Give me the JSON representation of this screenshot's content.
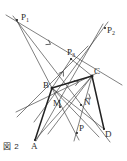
{
  "figure": {
    "caption": "図 2",
    "background_color": "#ffffff",
    "line_color": "#3a3a3a",
    "thick_line_color": "#222222",
    "label_color": "#2b2b2b",
    "width": 127,
    "height": 161
  },
  "points": [
    {
      "id": "P1",
      "label": "P",
      "subscript": "1",
      "x": 17,
      "y": 20,
      "label_x": 21,
      "label_y": 13
    },
    {
      "id": "P2",
      "label": "P",
      "subscript": "2",
      "x": 105,
      "y": 28,
      "label_x": 107,
      "label_y": 26
    },
    {
      "id": "P3",
      "label": "P",
      "subscript": "3",
      "x": 71,
      "y": 59,
      "label_x": 67,
      "label_y": 48
    },
    {
      "id": "B",
      "label": "B",
      "subscript": "",
      "x": 52,
      "y": 88,
      "label_x": 43,
      "label_y": 81
    },
    {
      "id": "C",
      "label": "C",
      "subscript": "",
      "x": 92,
      "y": 76,
      "label_x": 94,
      "label_y": 67
    },
    {
      "id": "M",
      "label": "M",
      "subscript": "",
      "x": 60,
      "y": 107,
      "label_x": 53,
      "label_y": 99
    },
    {
      "id": "N",
      "label": "N",
      "subscript": "",
      "x": 81,
      "y": 105,
      "label_x": 84,
      "label_y": 98
    },
    {
      "id": "P",
      "label": "P",
      "subscript": "",
      "x": 77,
      "y": 133,
      "label_x": 79,
      "label_y": 124
    },
    {
      "id": "A",
      "label": "A",
      "subscript": "",
      "x": 35,
      "y": 140,
      "label_x": 31,
      "label_y": 142
    },
    {
      "id": "D",
      "label": "D",
      "subscript": "",
      "x": 104,
      "y": 129,
      "label_x": 105,
      "label_y": 130
    }
  ],
  "segments": [
    {
      "name": "line-P1-P2",
      "x1": 6,
      "y1": 15,
      "x2": 122,
      "y2": 85,
      "weight": "thin"
    },
    {
      "name": "line-P1-D",
      "x1": 13,
      "y1": 16,
      "x2": 110,
      "y2": 142,
      "weight": "thin"
    },
    {
      "name": "line-P1-P",
      "x1": 16,
      "y1": 19,
      "x2": 79,
      "y2": 140,
      "weight": "thin"
    },
    {
      "name": "line-P2-B-lower",
      "x1": 108,
      "y1": 22,
      "x2": 34,
      "y2": 122,
      "weight": "thin"
    },
    {
      "name": "line-P2-P3-A",
      "x1": 103,
      "y1": 24,
      "x2": 36,
      "y2": 141,
      "weight": "thin"
    },
    {
      "name": "line-P3-B-left",
      "x1": 88,
      "y1": 46,
      "x2": 17,
      "y2": 117,
      "weight": "thin"
    },
    {
      "name": "line-C-B-M-left",
      "x1": 97,
      "y1": 73,
      "x2": 16,
      "y2": 112,
      "weight": "thin"
    },
    {
      "name": "segment-B-C",
      "x1": 52,
      "y1": 88,
      "x2": 92,
      "y2": 76,
      "weight": "thick"
    },
    {
      "name": "segment-B-A",
      "x1": 52,
      "y1": 88,
      "x2": 35,
      "y2": 140,
      "weight": "thick"
    },
    {
      "name": "segment-A-C",
      "x1": 35,
      "y1": 140,
      "x2": 92,
      "y2": 76,
      "weight": "thin"
    },
    {
      "name": "segment-C-D",
      "x1": 92,
      "y1": 76,
      "x2": 104,
      "y2": 129,
      "weight": "thick"
    },
    {
      "name": "segment-B-D",
      "x1": 52,
      "y1": 88,
      "x2": 104,
      "y2": 129,
      "weight": "thin"
    },
    {
      "name": "segment-B-N-ext",
      "x1": 52,
      "y1": 88,
      "x2": 99,
      "y2": 137,
      "weight": "thin"
    },
    {
      "name": "segment-C-M-ext",
      "x1": 92,
      "y1": 76,
      "x2": 48,
      "y2": 134,
      "weight": "thin"
    },
    {
      "name": "segment-B-P3",
      "x1": 52,
      "y1": 88,
      "x2": 71,
      "y2": 59,
      "weight": "thin"
    },
    {
      "name": "segment-C-P3",
      "x1": 92,
      "y1": 76,
      "x2": 71,
      "y2": 59,
      "weight": "thin"
    },
    {
      "name": "segment-C-P",
      "x1": 92,
      "y1": 76,
      "x2": 74,
      "y2": 141,
      "weight": "thin"
    }
  ],
  "arrow_marks": [
    {
      "name": "arrow-on-P1P2",
      "x": 50,
      "y": 44,
      "angle": 31
    },
    {
      "name": "arrow-B-to-P3",
      "x": 63,
      "y": 72,
      "angle": -57
    },
    {
      "name": "arrow-B-to-C",
      "x": 78,
      "y": 82,
      "angle": -17
    },
    {
      "name": "arrow-P2-tick",
      "x": 90,
      "y": 98,
      "angle": 35
    }
  ]
}
